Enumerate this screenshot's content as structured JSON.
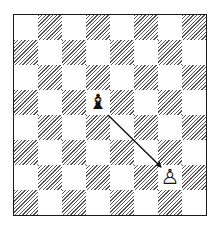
{
  "diagram": {
    "type": "chess-position",
    "orientation": "white-bottom",
    "files": [
      "a",
      "b",
      "c",
      "d",
      "e",
      "f",
      "g",
      "h"
    ],
    "ranks": [
      8,
      7,
      6,
      5,
      4,
      3,
      2,
      1
    ],
    "colors": {
      "border": "#1a1a1a",
      "dark_square_hatch": "#555555",
      "light_square": "#ffffff",
      "arrow": "#111111"
    },
    "pieces": [
      {
        "square": "d5",
        "color": "black",
        "type": "bishop",
        "glyph": "♝",
        "icon": "black-bishop-icon"
      },
      {
        "square": "g2",
        "color": "white",
        "type": "pawn",
        "glyph": "♙",
        "icon": "white-pawn-icon"
      }
    ],
    "arrows": [
      {
        "from": "d5",
        "to": "g2"
      }
    ]
  }
}
